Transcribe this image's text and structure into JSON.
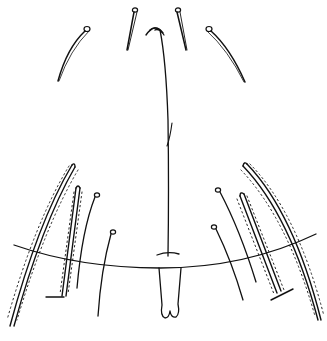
{
  "figure": {
    "type": "morphological line drawing",
    "background": "#ffffff",
    "ink_color": "#111111",
    "elements": [
      "median-ridge-line",
      "upper-setae-pair-inner",
      "upper-setae-pair-outer",
      "apical-hook",
      "transverse-suture-line",
      "median-process",
      "left-lateral-setae",
      "right-lateral-setae",
      "spinose-setae"
    ]
  }
}
